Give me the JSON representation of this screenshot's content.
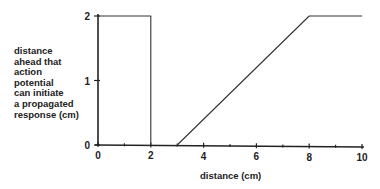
{
  "chart_data": {
    "type": "line",
    "title": "",
    "xlabel": "distance (cm)",
    "ylabel": "distance ahead that action potential can initiate a propagated response (cm)",
    "ylabel_lines": [
      "distance",
      "ahead that",
      "action",
      "potential",
      "can initiate",
      "a propagated",
      "response (cm)"
    ],
    "xlim": [
      0,
      10
    ],
    "ylim": [
      0,
      2
    ],
    "x_ticks": [
      0,
      2,
      4,
      6,
      8,
      10
    ],
    "x_minor_ticks": [
      1,
      3,
      5,
      7,
      9
    ],
    "y_ticks": [
      0,
      1,
      2
    ],
    "grid": false,
    "legend": null,
    "series": [
      {
        "name": "segment-1",
        "x": [
          0,
          2,
          2
        ],
        "y": [
          2,
          2,
          0
        ]
      },
      {
        "name": "segment-2",
        "x": [
          3,
          8,
          10
        ],
        "y": [
          0,
          2,
          2
        ]
      }
    ]
  },
  "labels": {
    "x_tick_labels": [
      "0",
      "2",
      "4",
      "6",
      "8",
      "10"
    ],
    "y_tick_labels": [
      "0",
      "1",
      "2"
    ]
  }
}
